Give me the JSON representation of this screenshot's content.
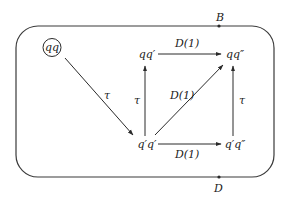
{
  "diagram": {
    "type": "state-transition",
    "frame": {
      "x": 16,
      "y": 26,
      "width": 258,
      "height": 151,
      "radius": 22
    },
    "boundary_points": [
      {
        "id": "B",
        "label": "B",
        "x": 219,
        "y": 26,
        "label_x": 216,
        "label_y": 21
      },
      {
        "id": "D",
        "label": "D",
        "x": 219,
        "y": 177,
        "label_x": 214,
        "label_y": 192
      }
    ],
    "nodes": [
      {
        "id": "qq",
        "label": "qq",
        "x": 52,
        "y": 51,
        "circled": true
      },
      {
        "id": "qq1",
        "label": "qq′",
        "x": 147,
        "y": 58
      },
      {
        "id": "qq2",
        "label": "qq″",
        "x": 235,
        "y": 58
      },
      {
        "id": "q1q1",
        "label": "q′q′",
        "x": 147,
        "y": 148
      },
      {
        "id": "q1q2",
        "label": "q′q″",
        "x": 235,
        "y": 148
      }
    ],
    "edges": [
      {
        "from": "qq",
        "to": "q1q1",
        "label": "τ",
        "x1": 65,
        "y1": 58,
        "x2": 133,
        "y2": 135,
        "lx": 104,
        "ly": 99
      },
      {
        "from": "q1q1",
        "to": "qq1",
        "label": "τ",
        "x1": 145,
        "y1": 136,
        "x2": 145,
        "y2": 66,
        "lx": 134,
        "ly": 104
      },
      {
        "from": "q1q2",
        "to": "qq2",
        "label": "τ",
        "x1": 233,
        "y1": 136,
        "x2": 233,
        "y2": 66,
        "lx": 239,
        "ly": 104
      },
      {
        "from": "qq1",
        "to": "qq2",
        "label": "D(1)",
        "x1": 158,
        "y1": 54,
        "x2": 221,
        "y2": 54,
        "lx": 175,
        "ly": 47
      },
      {
        "from": "q1q1",
        "to": "q1q2",
        "label": "D(1)",
        "x1": 158,
        "y1": 144,
        "x2": 221,
        "y2": 144,
        "lx": 175,
        "ly": 158
      },
      {
        "from": "q1q1",
        "to": "qq2",
        "label": "D(1)",
        "x1": 155,
        "y1": 135,
        "x2": 223,
        "y2": 65,
        "lx": 170,
        "ly": 99
      }
    ]
  },
  "colors": {
    "stroke": "#2a2a2a",
    "background": "#ffffff"
  }
}
